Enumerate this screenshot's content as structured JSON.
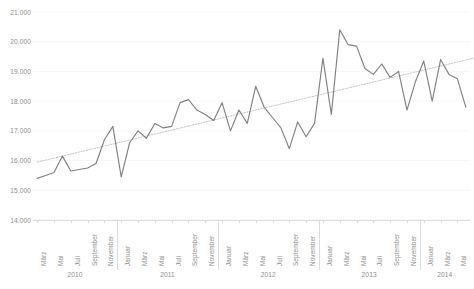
{
  "chart_data": {
    "type": "line",
    "title": "",
    "subtitle": "",
    "xlabel": "",
    "ylabel": "",
    "ylim": [
      14000,
      21000
    ],
    "yticks": [
      14000,
      15000,
      16000,
      17000,
      18000,
      19000,
      20000,
      21000
    ],
    "ytick_labels": [
      "14.000",
      "15.000",
      "16.000",
      "17.000",
      "18.000",
      "19.000",
      "20.000",
      "21.000"
    ],
    "grid": true,
    "legend": "none",
    "series_color": "#808080",
    "trendline_color": "#bfbfbf",
    "axis_color": "#d9d9d9",
    "label_color": "#8c8c8c",
    "x": [
      "März 2010",
      "April 2010",
      "Mai 2010",
      "Juni 2010",
      "Juli 2010",
      "August 2010",
      "September 2010",
      "Oktober 2010",
      "November 2010",
      "Dezember 2010",
      "Januar 2011",
      "Februar 2011",
      "März 2011",
      "April 2011",
      "Mai 2011",
      "Juni 2011",
      "Juli 2011",
      "August 2011",
      "September 2011",
      "Oktober 2011",
      "November 2011",
      "Dezember 2011",
      "Januar 2012",
      "Februar 2012",
      "März 2012",
      "April 2012",
      "Mai 2012",
      "Juni 2012",
      "Juli 2012",
      "August 2012",
      "September 2012",
      "Oktober 2012",
      "November 2012",
      "Dezember 2012",
      "Januar 2013",
      "Februar 2013",
      "März 2013",
      "April 2013",
      "Mai 2013",
      "Juni 2013",
      "Juli 2013",
      "August 2013",
      "September 2013",
      "Oktober 2013",
      "November 2013",
      "Dezember 2013",
      "Januar 2014",
      "Februar 2014",
      "März 2014",
      "April 2014",
      "Mai 2014",
      "Juni 2014"
    ],
    "values": [
      15400,
      15500,
      15600,
      16150,
      15650,
      15700,
      15750,
      15900,
      16700,
      17150,
      15450,
      16600,
      17000,
      16750,
      17250,
      17100,
      17150,
      17950,
      18050,
      17700,
      17550,
      17350,
      17950,
      17000,
      17700,
      17250,
      18500,
      17800,
      17450,
      17100,
      16400,
      17300,
      16800,
      17250,
      19450,
      17550,
      20400,
      19900,
      19850,
      19100,
      18900,
      19250,
      18800,
      19000,
      17700,
      18650,
      19350,
      18000,
      19400,
      18900,
      18750,
      17800
    ],
    "trendline": {
      "type": "linear",
      "start_value": 15950,
      "end_value": 19450,
      "style": "dotted"
    },
    "months_per_year_shown": [
      "Januar",
      "März",
      "Mai",
      "Juli",
      "September",
      "November"
    ],
    "x_tick_labels": [
      "März",
      "Mai",
      "Juli",
      "September",
      "November",
      "Januar",
      "März",
      "Mai",
      "Juli",
      "September",
      "November",
      "Januar",
      "März",
      "Mai",
      "Juli",
      "September",
      "November",
      "Januar",
      "März",
      "Mai",
      "Juli",
      "September",
      "November",
      "Januar",
      "März",
      "Mai"
    ],
    "x_tick_indices": [
      0,
      2,
      4,
      6,
      8,
      10,
      12,
      14,
      16,
      18,
      20,
      22,
      24,
      26,
      28,
      30,
      32,
      34,
      36,
      38,
      40,
      42,
      44,
      46,
      48,
      50
    ],
    "year_groups": [
      {
        "label": "2010",
        "start_index": 0,
        "end_index": 9
      },
      {
        "label": "2011",
        "start_index": 10,
        "end_index": 21
      },
      {
        "label": "2012",
        "start_index": 22,
        "end_index": 33
      },
      {
        "label": "2013",
        "start_index": 34,
        "end_index": 45
      },
      {
        "label": "2014",
        "start_index": 46,
        "end_index": 51
      }
    ]
  }
}
